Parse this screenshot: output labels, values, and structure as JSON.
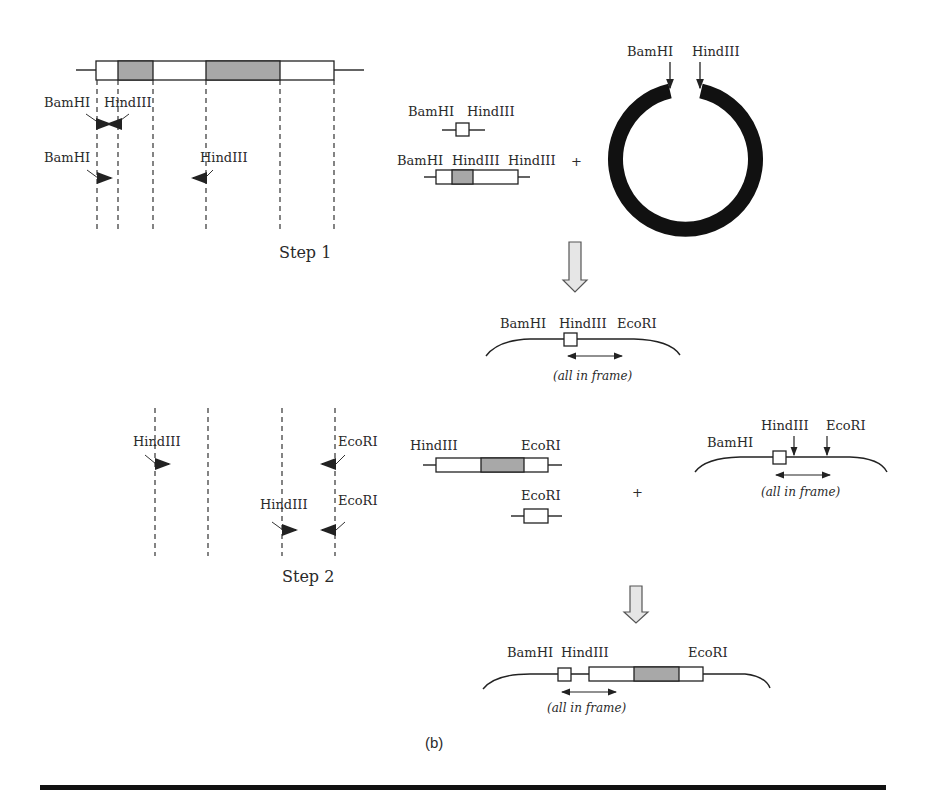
{
  "figure": {
    "panel_label": "(b)",
    "colors": {
      "shaded_region": "#a8a8a8",
      "line": "#222222",
      "arrow_fill": "#e6e6e6"
    },
    "step1": {
      "label": "Step 1",
      "primer_row1": {
        "left": "BamHI",
        "right": "HindIII"
      },
      "primer_row2": {
        "left": "BamHI",
        "right": "HindIII"
      },
      "fragment_small": {
        "left": "BamHI",
        "right": "HindIII"
      },
      "fragment_large": {
        "left": "BamHI",
        "middle": "HindIII",
        "right": "HindIII"
      },
      "plus": "+",
      "plasmid": {
        "left": "BamHI",
        "right": "HindIII"
      }
    },
    "intermediate": {
      "sites": [
        "BamHI",
        "HindIII",
        "EcoRI"
      ],
      "note": "(all in frame)"
    },
    "step2": {
      "label": "Step 2",
      "primer_row1": {
        "left": "HindIII",
        "right": "EcoRI"
      },
      "primer_row2": {
        "left": "HindIII",
        "right": "EcoRI"
      },
      "fragment_large": {
        "left": "HindIII",
        "right": "EcoRI"
      },
      "fragment_small": {
        "right": "EcoRI"
      },
      "plus": "+",
      "vector": {
        "sites": [
          "BamHI",
          "HindIII",
          "EcoRI"
        ],
        "note": "(all in frame)"
      }
    },
    "final": {
      "sites": [
        "BamHI",
        "HindIII",
        "EcoRI"
      ],
      "note": "(all in frame)"
    }
  }
}
